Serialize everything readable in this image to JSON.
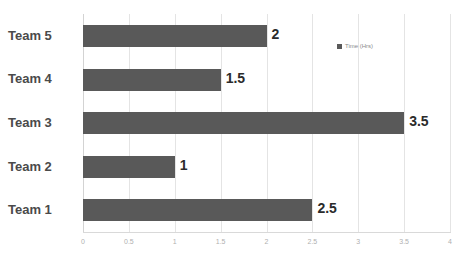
{
  "chart_data": {
    "type": "bar",
    "orientation": "horizontal",
    "title": "",
    "xlabel": "",
    "ylabel": "",
    "categories": [
      "Team 1",
      "Team 2",
      "Team 3",
      "Team 4",
      "Team 5"
    ],
    "values": [
      2.5,
      1,
      3.5,
      1.5,
      2
    ],
    "value_labels": [
      "2.5",
      "1",
      "3.5",
      "1.5",
      "2"
    ],
    "series": [
      {
        "name": "Time (Hrs)",
        "values": [
          2.5,
          1,
          3.5,
          1.5,
          2
        ],
        "color": "#595959"
      }
    ],
    "xlim": [
      0,
      4
    ],
    "xticks": [
      0,
      0.5,
      1,
      1.5,
      2,
      2.5,
      3,
      3.5,
      4
    ],
    "xtick_labels": [
      "0",
      "0.5",
      "1",
      "1.5",
      "2",
      "2.5",
      "3",
      "3.5",
      "4"
    ],
    "grid": "vertical",
    "legend_position": "right",
    "legend_entries": [
      "Time (Hrs)"
    ],
    "bar_color": "#595959",
    "gridline_color": "#e4e4e4",
    "label_color": "#4a4a4a",
    "tick_color": "#b0b0b0"
  },
  "legend": {
    "label": "Time (Hrs)"
  }
}
